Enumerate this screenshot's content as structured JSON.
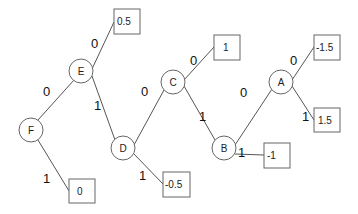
{
  "diagram": {
    "type": "binary decision tree",
    "nodes": [
      {
        "id": "F",
        "label": "F",
        "cx": 31,
        "cy": 130
      },
      {
        "id": "E",
        "label": "E",
        "cx": 81,
        "cy": 71
      },
      {
        "id": "D",
        "label": "D",
        "cx": 123,
        "cy": 148
      },
      {
        "id": "C",
        "label": "C",
        "cx": 173,
        "cy": 82
      },
      {
        "id": "B",
        "label": "B",
        "cx": 224,
        "cy": 148
      },
      {
        "id": "A",
        "label": "A",
        "cx": 281,
        "cy": 82
      }
    ],
    "leaves": [
      {
        "id": "L_E0",
        "value": "0.5",
        "x": 114,
        "y": 9
      },
      {
        "id": "L_F1",
        "value": "0",
        "x": 69,
        "y": 179
      },
      {
        "id": "L_D1",
        "value": "-0.5",
        "x": 163,
        "y": 172
      },
      {
        "id": "L_C0",
        "value": "1",
        "x": 214,
        "y": 35
      },
      {
        "id": "L_B1",
        "value": "-1",
        "x": 264,
        "y": 143
      },
      {
        "id": "L_A0",
        "value": "-1.5",
        "x": 314,
        "y": 35
      },
      {
        "id": "L_A1",
        "value": "1.5",
        "x": 314,
        "y": 108
      }
    ],
    "edges": [
      {
        "from": "F",
        "to": "E",
        "label": "0"
      },
      {
        "from": "F",
        "to": "L_F1",
        "label": "1"
      },
      {
        "from": "E",
        "to": "L_E0",
        "label": "0"
      },
      {
        "from": "E",
        "to": "D",
        "label": "1"
      },
      {
        "from": "D",
        "to": "C",
        "label": "0"
      },
      {
        "from": "D",
        "to": "L_D1",
        "label": "1"
      },
      {
        "from": "C",
        "to": "L_C0",
        "label": "0"
      },
      {
        "from": "C",
        "to": "B",
        "label": "1"
      },
      {
        "from": "B",
        "to": "A",
        "label": "0"
      },
      {
        "from": "B",
        "to": "L_B1",
        "label": "1"
      },
      {
        "from": "A",
        "to": "L_A0",
        "label": "0"
      },
      {
        "from": "A",
        "to": "L_A1",
        "label": "1"
      }
    ]
  }
}
